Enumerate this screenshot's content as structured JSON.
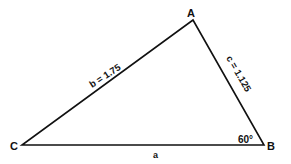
{
  "diagram": {
    "type": "triangle",
    "vertices": {
      "A": {
        "label": "A"
      },
      "B": {
        "label": "B"
      },
      "C": {
        "label": "C"
      }
    },
    "sides": {
      "a": {
        "label": "a"
      },
      "b": {
        "label": "b = 1.75"
      },
      "c": {
        "label": "c = 1.125"
      }
    },
    "angle_B": {
      "label": "60°"
    },
    "colors": {
      "stroke": "#111111",
      "background": "#ffffff"
    }
  }
}
